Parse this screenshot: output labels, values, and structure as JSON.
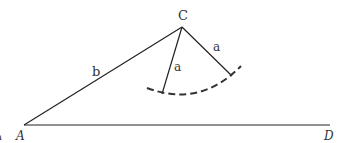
{
  "diagram": {
    "points": {
      "A": {
        "label": "A",
        "x": 24,
        "y": 125
      },
      "C": {
        "label": "C",
        "x": 182,
        "y": 27
      },
      "D": {
        "label": "D",
        "x": 330,
        "y": 125
      }
    },
    "segments": {
      "AC": {
        "label": "b"
      },
      "C_to_arc_left": {
        "label": "a"
      },
      "C_to_arc_right": {
        "label": "a"
      }
    },
    "edge_mark": "a",
    "stroke_color": "#222222",
    "arc_style": "dashed"
  }
}
